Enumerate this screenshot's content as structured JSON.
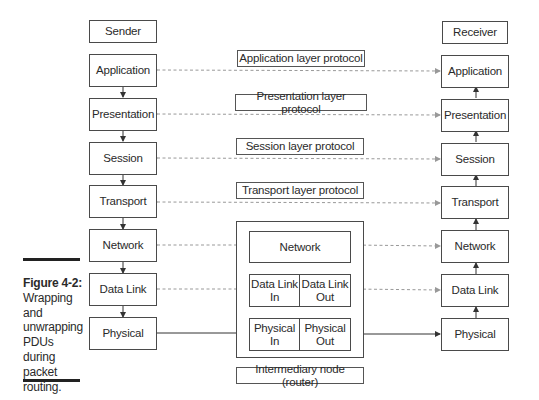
{
  "sender": {
    "title": "Sender",
    "layers": [
      "Application",
      "Presentation",
      "Session",
      "Transport",
      "Network",
      "Data Link",
      "Physical"
    ]
  },
  "receiver": {
    "title": "Receiver",
    "layers": [
      "Application",
      "Presentation",
      "Session",
      "Transport",
      "Network",
      "Data Link",
      "Physical"
    ]
  },
  "protocols": {
    "application": "Application layer protocol",
    "presentation": "Presentation layer protocol",
    "session": "Session layer protocol",
    "transport": "Transport layer protocol"
  },
  "router": {
    "label": "Intermediary node (router)",
    "network": "Network",
    "datalink_in": "Data Link\nIn",
    "datalink_out": "Data Link\nOut",
    "physical_in": "Physical\nIn",
    "physical_out": "Physical\nOut"
  },
  "caption": {
    "figure": "Figure 4-2:",
    "text": "Wrapping and unwrapping PDUs during packet routing."
  }
}
